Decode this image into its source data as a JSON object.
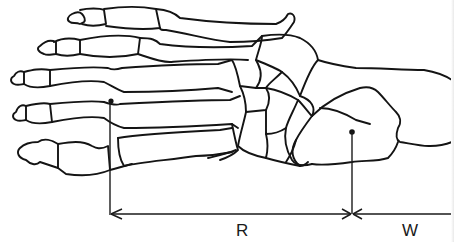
{
  "figure": {
    "parts": [
      "phalanges",
      "metatarsals",
      "cuneiforms",
      "cuboid",
      "navicular",
      "talus",
      "calcaneus"
    ],
    "colors": {
      "line": "#141414",
      "background": "#ffffff"
    }
  },
  "measurements": {
    "segments": [
      {
        "label": "R",
        "from": "metatarsal head marker",
        "to": "heel marker"
      },
      {
        "label": "W",
        "from": "heel marker",
        "to": "right edge"
      }
    ],
    "markers": [
      {
        "name": "metatarsal-head-point"
      },
      {
        "name": "calcaneus-point"
      }
    ]
  },
  "labels": {
    "r": "R",
    "w": "W"
  }
}
